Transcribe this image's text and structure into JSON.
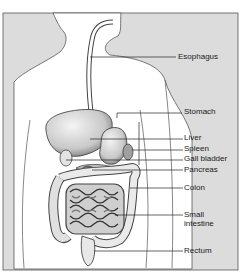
{
  "colors": {
    "background": "#dcdcdc",
    "body_fill": "#ffffff",
    "outline": "#333333",
    "leader": "#222222",
    "organ_fill": "#e6e6e6",
    "organ_shade": "#9a9a9a"
  },
  "labels": [
    {
      "id": "esophagus",
      "text": "Esophagus"
    },
    {
      "id": "stomach",
      "text": "Stomach"
    },
    {
      "id": "liver",
      "text": "Liver"
    },
    {
      "id": "spleen",
      "text": "Spleen"
    },
    {
      "id": "gall-bladder",
      "text": "Gall bladder"
    },
    {
      "id": "pancreas",
      "text": "Pancreas"
    },
    {
      "id": "colon",
      "text": "Colon"
    },
    {
      "id": "small-intestine",
      "text": "Small intestine"
    },
    {
      "id": "rectum",
      "text": "Rectum"
    }
  ]
}
